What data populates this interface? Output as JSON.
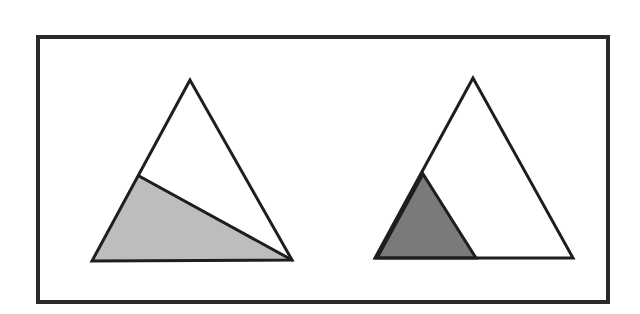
{
  "diagram": {
    "colors": {
      "background": "#ffffff",
      "stroke": "#1e1e1e",
      "frame_stroke": "#2a2a2a",
      "light_shade": "#bdbdbd",
      "dark_shade": "#7a7a7a",
      "unshaded": "#ffffff"
    },
    "frame": {
      "x": 38,
      "y": 37,
      "width": 570,
      "height": 265,
      "stroke_width": 4
    },
    "left_figure": {
      "outer_triangle": {
        "points": "190,80 92,261 292,260",
        "fill": "#ffffff"
      },
      "shaded_region": {
        "points": "139,176 92,261 292,260",
        "fill": "#bdbdbd"
      },
      "cut_line": {
        "x1": 139,
        "y1": 176,
        "x2": 292,
        "y2": 260
      }
    },
    "right_figure": {
      "outer_triangle": {
        "points": "473,78 375,258 573,258",
        "fill": "#ffffff"
      },
      "shaded_triangle": {
        "points": "423,174 377,258 476,258",
        "fill": "#7a7a7a"
      }
    }
  }
}
